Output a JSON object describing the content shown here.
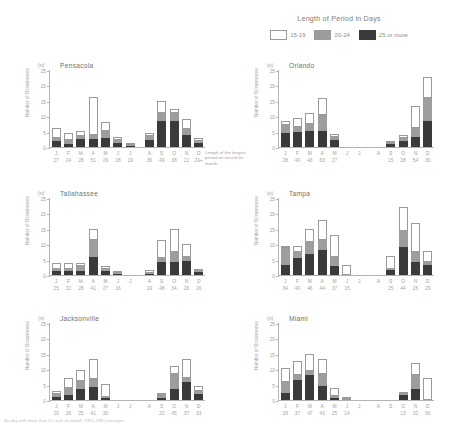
{
  "legend": {
    "title": "Length of Period in Days",
    "items": [
      {
        "label": "15-19",
        "color": "#ffffff",
        "name": "legend-swatch-15-19"
      },
      {
        "label": "20-24",
        "color": "#9d9d9d",
        "name": "legend-swatch-20-24"
      },
      {
        "label": "25 or more",
        "color": "#3a3a3a",
        "name": "legend-swatch-25-or-more"
      }
    ]
  },
  "annotation": {
    "text": "Length of the longest period on record for month",
    "arrow": "←"
  },
  "footnote": "No day with more than 0.1 inch of rainfall. 1951-1980 averages.",
  "axis": {
    "unit": "(n)",
    "ylabel": "Number of Occurrences",
    "ticks": [
      "25",
      "20",
      "15",
      "10",
      "5",
      "0"
    ],
    "ymax": 25,
    "months": [
      "J",
      "F",
      "M",
      "A",
      "M",
      "J",
      "J",
      "A",
      "S",
      "O",
      "N",
      "D"
    ]
  },
  "chart_data": [
    {
      "type": "bar",
      "title": "Pensacola",
      "stacked": true,
      "categories": [
        "J",
        "F",
        "M",
        "A",
        "M",
        "J",
        "J",
        "A",
        "S",
        "O",
        "N",
        "D"
      ],
      "record_lengths": [
        "27",
        "24",
        "28",
        "51",
        "29",
        "28",
        "19",
        "36",
        "49",
        "38",
        "22",
        "21+"
      ],
      "series": [
        {
          "name": "25 or more",
          "values": [
            2.0,
            1.0,
            2.6,
            2.5,
            3.0,
            1.4,
            0.3,
            2.2,
            8.3,
            8.5,
            4.0,
            1.2
          ]
        },
        {
          "name": "20-24",
          "values": [
            0.9,
            1.3,
            0.9,
            1.3,
            2.3,
            1.0,
            0.1,
            1.3,
            2.8,
            2.6,
            1.9,
            0.6
          ]
        },
        {
          "name": "15-19",
          "values": [
            3.2,
            2.3,
            1.6,
            12.3,
            2.9,
            0.8,
            0.2,
            0.9,
            3.8,
            1.3,
            3.2,
            1.0
          ]
        }
      ],
      "ylabel": "Number of Occurrences",
      "ylim": [
        0,
        25
      ]
    },
    {
      "type": "bar",
      "title": "Orlando",
      "stacked": true,
      "categories": [
        "J",
        "F",
        "M",
        "A",
        "M",
        "J",
        "J",
        "A",
        "S",
        "O",
        "N",
        "D"
      ],
      "record_lengths": [
        "28",
        "40",
        "43",
        "63",
        "27",
        "",
        "",
        "",
        "15",
        "28",
        "54",
        "30",
        "31"
      ],
      "series": [
        {
          "name": "25 or more",
          "values": [
            4.7,
            4.8,
            5.1,
            5.2,
            2.2,
            0.0,
            0.0,
            0.0,
            1.0,
            2.0,
            3.3,
            8.6,
            4.0
          ]
        },
        {
          "name": "20-24",
          "values": [
            2.3,
            1.8,
            2.3,
            5.3,
            1.1,
            0.0,
            0.0,
            0.0,
            0.3,
            1.0,
            3.0,
            7.3,
            2.3
          ]
        },
        {
          "name": "15-19",
          "values": [
            1.5,
            2.8,
            3.8,
            5.4,
            1.0,
            0.0,
            0.0,
            0.0,
            0.3,
            0.8,
            7.0,
            7.0,
            9.5
          ]
        }
      ],
      "ylabel": "Number of Occurrences",
      "ylim": [
        0,
        25
      ]
    },
    {
      "type": "bar",
      "title": "Tallahassee",
      "stacked": true,
      "categories": [
        "J",
        "F",
        "M",
        "A",
        "M",
        "J",
        "J",
        "A",
        "S",
        "O",
        "N",
        "D"
      ],
      "record_lengths": [
        "25",
        "32",
        "28",
        "41",
        "27",
        "16",
        "",
        "19",
        "48",
        "34",
        "26",
        "26"
      ],
      "series": [
        {
          "name": "25 or more",
          "values": [
            1.2,
            1.2,
            1.4,
            5.7,
            1.3,
            0.3,
            0.0,
            0.3,
            4.3,
            4.2,
            4.6,
            0.9
          ]
        },
        {
          "name": "20-24",
          "values": [
            0.8,
            0.6,
            1.4,
            5.8,
            0.7,
            0.2,
            0.0,
            0.4,
            1.2,
            3.4,
            1.3,
            0.4
          ]
        },
        {
          "name": "15-19",
          "values": [
            2.0,
            2.0,
            1.2,
            3.5,
            1.0,
            0.2,
            0.0,
            0.8,
            6.0,
            7.4,
            4.1,
            0.3
          ]
        }
      ],
      "ylabel": "Number of Occurrences",
      "ylim": [
        0,
        25
      ]
    },
    {
      "type": "bar",
      "title": "Tampa",
      "stacked": true,
      "categories": [
        "J",
        "F",
        "M",
        "A",
        "M",
        "J",
        "J",
        "A",
        "S",
        "O",
        "N",
        "D"
      ],
      "record_lengths": [
        "34",
        "40",
        "46",
        "44",
        "37",
        "15",
        "",
        "",
        "25",
        "44",
        "26",
        "29"
      ],
      "series": [
        {
          "name": "25 or more",
          "values": [
            3.2,
            5.4,
            6.8,
            8.2,
            2.8,
            0.0,
            0.0,
            0.0,
            1.6,
            9.2,
            4.3,
            3.4
          ]
        },
        {
          "name": "20-24",
          "values": [
            5.5,
            2.0,
            3.8,
            3.2,
            3.0,
            0.0,
            0.0,
            0.0,
            0.5,
            5.0,
            3.2,
            0.9
          ]
        },
        {
          "name": "15-19",
          "values": [
            0.5,
            2.0,
            4.5,
            6.5,
            7.3,
            3.1,
            0.0,
            0.0,
            4.0,
            8.0,
            9.5,
            3.5
          ]
        }
      ],
      "ylabel": "Number of Occurrences",
      "ylim": [
        0,
        25
      ]
    },
    {
      "type": "bar",
      "title": "Jacksonville",
      "stacked": true,
      "categories": [
        "J",
        "F",
        "M",
        "A",
        "M",
        "J",
        "J",
        "A",
        "S",
        "O",
        "N",
        "D"
      ],
      "record_lengths": [
        "20",
        "26",
        "25",
        "41",
        "30",
        "",
        "",
        "",
        "20",
        "45",
        "37",
        "33"
      ],
      "series": [
        {
          "name": "25 or more",
          "values": [
            1.0,
            1.7,
            3.6,
            4.1,
            0.6,
            0.0,
            0.0,
            0.0,
            0.8,
            3.5,
            5.7,
            2.0
          ]
        },
        {
          "name": "20-24",
          "values": [
            0.8,
            2.2,
            2.6,
            2.8,
            0.3,
            0.0,
            0.0,
            0.0,
            0.9,
            5.1,
            1.5,
            0.8
          ]
        },
        {
          "name": "15-19",
          "values": [
            1.0,
            3.4,
            3.4,
            6.5,
            4.2,
            0.0,
            0.0,
            0.0,
            0.6,
            2.4,
            6.1,
            1.6
          ]
        }
      ],
      "ylabel": "Number of Occurrences",
      "ylim": [
        0,
        25
      ]
    },
    {
      "type": "bar",
      "title": "Miami",
      "stacked": true,
      "categories": [
        "J",
        "F",
        "M",
        "A",
        "M",
        "J",
        "J",
        "A",
        "S",
        "O",
        "N",
        "D"
      ],
      "record_lengths": [
        "29",
        "37",
        "47",
        "43",
        "25",
        "14",
        "",
        "",
        "",
        "13",
        "32",
        "56",
        "37"
      ],
      "series": [
        {
          "name": "25 or more",
          "values": [
            2.3,
            6.4,
            8.2,
            4.4,
            0.6,
            0.0,
            0.0,
            0.0,
            0.0,
            1.6,
            3.6,
            0.0,
            0.0
          ]
        },
        {
          "name": "20-24",
          "values": [
            3.4,
            1.6,
            1.1,
            4.2,
            0.8,
            0.2,
            0.0,
            0.0,
            0.0,
            0.3,
            4.6,
            0.0,
            0.0
          ]
        },
        {
          "name": "15-19",
          "values": [
            4.8,
            4.6,
            5.5,
            4.6,
            2.4,
            0.2,
            0.0,
            0.0,
            0.0,
            0.6,
            3.8,
            7.0,
            0.0
          ]
        }
      ],
      "ylabel": "Number of Occurrences",
      "ylim": [
        0,
        25
      ]
    }
  ],
  "panels": [
    {
      "key": 0,
      "left": 16,
      "top": 62
    },
    {
      "key": 1,
      "left": 245,
      "top": 62
    },
    {
      "key": 2,
      "left": 16,
      "top": 190
    },
    {
      "key": 3,
      "left": 245,
      "top": 190
    },
    {
      "key": 4,
      "left": 16,
      "top": 315
    },
    {
      "key": 5,
      "left": 245,
      "top": 315
    }
  ]
}
